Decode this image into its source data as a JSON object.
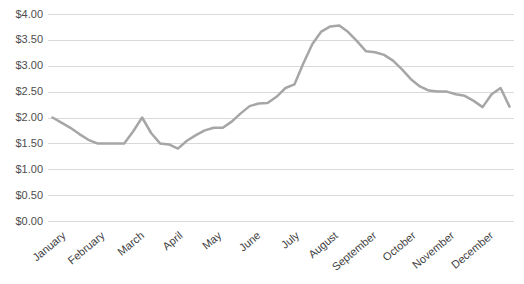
{
  "chart_data": {
    "type": "line",
    "title": "",
    "legend": "none",
    "grid": "horizontal",
    "x_axis": {
      "month_labels": [
        "January",
        "February",
        "March",
        "April",
        "May",
        "June",
        "July",
        "August",
        "September",
        "October",
        "November",
        "December"
      ],
      "label_rotation_deg": -40
    },
    "y_axis": {
      "tick_labels": [
        "$0.00",
        "$0.50",
        "$1.00",
        "$1.50",
        "$2.00",
        "$2.50",
        "$3.00",
        "$3.50",
        "$4.00"
      ],
      "ylim": [
        0,
        4
      ],
      "tick_step": 0.5
    },
    "series": [
      {
        "color": "#A6A6A6",
        "values": [
          2.0,
          1.9,
          1.8,
          1.68,
          1.57,
          1.5,
          1.5,
          1.5,
          1.5,
          1.73,
          2.0,
          1.7,
          1.5,
          1.48,
          1.4,
          1.55,
          1.66,
          1.75,
          1.8,
          1.8,
          1.92,
          2.08,
          2.22,
          2.27,
          2.28,
          2.4,
          2.57,
          2.64,
          3.05,
          3.42,
          3.66,
          3.76,
          3.78,
          3.65,
          3.47,
          3.28,
          3.26,
          3.21,
          3.1,
          2.93,
          2.74,
          2.6,
          2.52,
          2.5,
          2.5,
          2.45,
          2.42,
          2.32,
          2.2,
          2.45,
          2.57,
          2.21
        ]
      }
    ],
    "colors": {
      "line": "#A6A6A6",
      "gridline": "#D9D9D9",
      "y_label_text": "#4d4d4d",
      "x_label_text": "#404040",
      "background": "#FFFFFF"
    }
  }
}
